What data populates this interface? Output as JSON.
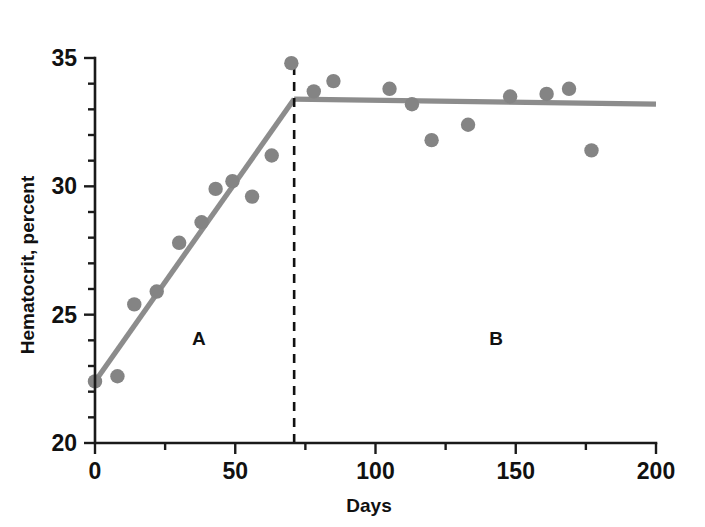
{
  "chart_data": {
    "type": "scatter",
    "title": "",
    "subtitle": "",
    "xlabel": "Days",
    "ylabel": "Hematocrit, percent",
    "xlim": [
      0,
      200
    ],
    "ylim": [
      20,
      35
    ],
    "x_ticks": [
      0,
      50,
      100,
      150,
      200
    ],
    "x_tick_labels": [
      "0",
      "50",
      "100",
      "150",
      "200"
    ],
    "x_minor_tick_step": 25,
    "y_ticks": [
      20,
      25,
      30,
      35
    ],
    "y_tick_labels": [
      "20",
      "25",
      "30",
      "35"
    ],
    "y_minor_tick_step": 1,
    "grid": false,
    "legend": "none",
    "marker_color": "#848484",
    "line_color": "#8c8c8c",
    "axis_color": "#1a1a1a",
    "breakpoint_day": 71,
    "plateau_value": 33.4,
    "series": [
      {
        "name": "Hematocrit measurements",
        "marker": "circle",
        "points": [
          {
            "x": 0,
            "y": 22.4
          },
          {
            "x": 8,
            "y": 22.6
          },
          {
            "x": 14,
            "y": 25.4
          },
          {
            "x": 22,
            "y": 25.9
          },
          {
            "x": 30,
            "y": 27.8
          },
          {
            "x": 38,
            "y": 28.6
          },
          {
            "x": 43,
            "y": 29.9
          },
          {
            "x": 49,
            "y": 30.2
          },
          {
            "x": 56,
            "y": 29.6
          },
          {
            "x": 63,
            "y": 31.2
          },
          {
            "x": 70,
            "y": 34.8
          },
          {
            "x": 78,
            "y": 33.7
          },
          {
            "x": 85,
            "y": 34.1
          },
          {
            "x": 105,
            "y": 33.8
          },
          {
            "x": 113,
            "y": 33.2
          },
          {
            "x": 120,
            "y": 31.8
          },
          {
            "x": 133,
            "y": 32.4
          },
          {
            "x": 148,
            "y": 33.5
          },
          {
            "x": 161,
            "y": 33.6
          },
          {
            "x": 169,
            "y": 33.8
          },
          {
            "x": 177,
            "y": 31.4
          }
        ]
      }
    ],
    "fit_segments": [
      {
        "name": "phase-a-regression",
        "from": {
          "x": 0,
          "y": 22.4
        },
        "to": {
          "x": 71,
          "y": 33.4
        }
      },
      {
        "name": "phase-b-plateau",
        "from": {
          "x": 71,
          "y": 33.4
        },
        "to": {
          "x": 200,
          "y": 33.2
        }
      }
    ],
    "annotations": [
      {
        "name": "region-a-label",
        "text": "A",
        "x": 37,
        "y": 23.8
      },
      {
        "name": "region-b-label",
        "text": "B",
        "x": 143,
        "y": 23.8
      }
    ],
    "reference_lines": [
      {
        "name": "breakpoint-dashed-line",
        "orientation": "vertical",
        "x": 71,
        "style": "dashed"
      }
    ]
  }
}
